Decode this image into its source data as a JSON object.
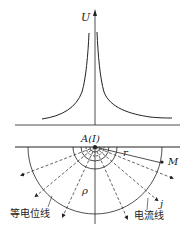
{
  "diagram": {
    "title": "",
    "upper_plot": {
      "y_axis_label": "U",
      "curve": "potential distribution, symmetric peak at source A"
    },
    "lower_section": {
      "source_label": "A(I)",
      "point_label": "M",
      "radius_label": "r",
      "resistivity_label": "ρ",
      "current_density_label": "j",
      "equipotential_label": "等电位线",
      "current_line_label": "电流线"
    },
    "colors": {
      "line": "#222222",
      "background": "#ffffff"
    }
  }
}
